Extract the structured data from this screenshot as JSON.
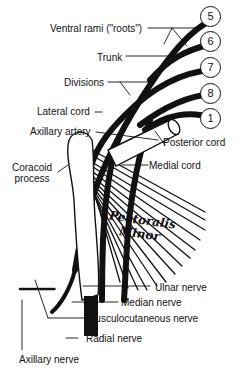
{
  "figure": {
    "roots": [
      {
        "id": "c5",
        "label": "5",
        "x": 219,
        "y": 12
      },
      {
        "id": "c6",
        "label": "6",
        "x": 219,
        "y": 36
      },
      {
        "id": "c7",
        "label": "7",
        "x": 219,
        "y": 62
      },
      {
        "id": "c8",
        "label": "8",
        "x": 219,
        "y": 86
      },
      {
        "id": "t1",
        "label": "1",
        "x": 219,
        "y": 110
      }
    ],
    "labels": {
      "ventral_rami": "Ventral rami (\"roots\")",
      "trunk": "Trunk",
      "divisions": "Divisions",
      "lateral_cord": "Lateral cord",
      "axillary_artery": "Axillary artery",
      "posterior_cord": "Posterior cord",
      "coracoid_line1": "Coracoid",
      "coracoid_line2": "process",
      "medial_cord": "Medial cord",
      "pectoralis_line1": "Pectoralis",
      "pectoralis_line2": "Minor",
      "ulnar_nerve": "Ulnar nerve",
      "median_nerve": "Median nerve",
      "musculocutaneous_nerve": "Musculocutaneous nerve",
      "radial_nerve": "Radial nerve",
      "axillary_nerve": "Axillary nerve"
    },
    "colors": {
      "ink": "#111111",
      "background": "#ffffff"
    }
  }
}
